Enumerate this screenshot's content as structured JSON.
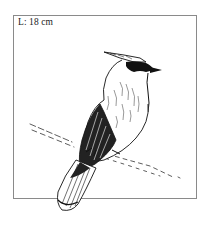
{
  "figure": {
    "size_label": "L: 18 cm"
  },
  "colors": {
    "frame": "#8a8a8a",
    "ink": "#111111",
    "background": "#ffffff"
  }
}
